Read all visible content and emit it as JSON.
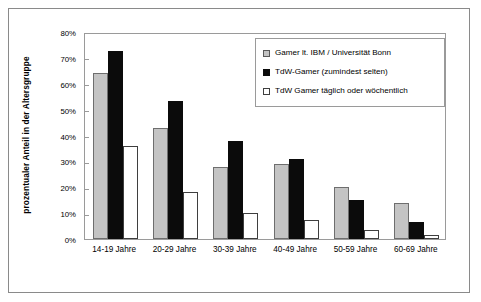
{
  "chart_data": {
    "type": "bar",
    "title": "",
    "subtitle": "",
    "xlabel": "",
    "ylabel": "prozentualer Anteil in der Altersgruppe",
    "ylim": [
      0,
      80
    ],
    "ytick_labels": [
      "0%",
      "10%",
      "20%",
      "30%",
      "40%",
      "50%",
      "60%",
      "70%",
      "80%"
    ],
    "ytick_values": [
      0,
      10,
      20,
      30,
      40,
      50,
      60,
      70,
      80
    ],
    "grid": false,
    "legend_position": "top-right",
    "categories": [
      "14-19 Jahre",
      "20-29 Jahre",
      "30-39 Jahre",
      "40-49 Jahre",
      "50-59 Jahre",
      "60-69 Jahre"
    ],
    "series": [
      {
        "name": "Gamer lt. IBM / Universität Bonn",
        "color": "#c4c4c4",
        "values": [
          64,
          43,
          28,
          29,
          20,
          14
        ]
      },
      {
        "name": "TdW-Gamer (zumindest selten)",
        "color": "#0b0b0b",
        "values": [
          72.5,
          53.5,
          38,
          31,
          15,
          6.5
        ]
      },
      {
        "name": "TdW Gamer täglich oder wöchentlich",
        "color": "#ffffff",
        "values": [
          36,
          18,
          10,
          7.5,
          3.5,
          1.5
        ]
      }
    ]
  },
  "legend": {
    "items": [
      {
        "label": "Gamer lt. IBM / Universität Bonn"
      },
      {
        "label": "TdW-Gamer (zumindest selten)"
      },
      {
        "label": "TdW Gamer täglich oder wöchentlich"
      }
    ]
  },
  "colors": {
    "series_gray": "#c4c4c4",
    "series_black": "#0b0b0b",
    "series_white": "#ffffff",
    "frame": "#8a8a8a",
    "axis": "#9a9a9a",
    "text": "#000000",
    "background": "#ffffff"
  }
}
